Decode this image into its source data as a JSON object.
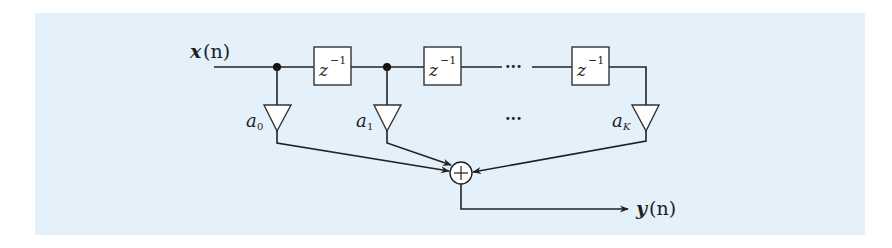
{
  "diagram": {
    "type": "FIR filter block diagram (tapped delay line)",
    "background_color": "#e4f0fa",
    "line_color": "#222222",
    "input": {
      "label": "x",
      "arg": "(n)"
    },
    "output": {
      "label": "y",
      "arg": "(n)"
    },
    "delays": [
      {
        "id": "delay-1",
        "label": "z",
        "exp": "−1"
      },
      {
        "id": "delay-2",
        "label": "z",
        "exp": "−1"
      },
      {
        "id": "delay-K",
        "label": "z",
        "exp": "−1"
      }
    ],
    "gains": [
      {
        "id": "gain-0",
        "label": "a",
        "sub": "0"
      },
      {
        "id": "gain-1",
        "label": "a",
        "sub": "1"
      },
      {
        "id": "gain-K",
        "label": "a",
        "sub": "K"
      }
    ],
    "ellipsis_top": "···",
    "ellipsis_bottom": "···",
    "adder": {
      "symbol": "+"
    }
  }
}
